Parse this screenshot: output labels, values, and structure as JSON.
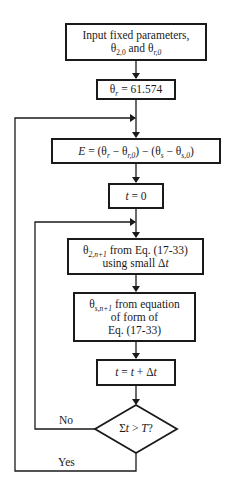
{
  "flowchart": {
    "boxes": {
      "input": {
        "line1": "Input fixed parameters,",
        "theta": "θ",
        "sub1": "2,0",
        "and": " and ",
        "sub2": "r,0"
      },
      "theta_r": {
        "theta": "θ",
        "sub": "r",
        "eq": " = 61.574"
      },
      "error": {
        "text_E": "E",
        "eq1": " = (θ",
        "sub_r": "r",
        "minus1": " − θ",
        "sub_r0": "r,0",
        "mid": ") − (θ",
        "sub_s": "s",
        "minus2": " − θ",
        "sub_s0": "s,0",
        "close": ")"
      },
      "t_init": {
        "t": "t",
        "eq": " = 0"
      },
      "theta2_step": {
        "theta": "θ",
        "sub": "2,n+1",
        "rest1": " from Eq. (17-33)",
        "line2a": "using small Δ",
        "line2b": "t"
      },
      "thetas_step": {
        "theta": "θ",
        "sub": "s,n+1",
        "rest1": " from equation",
        "line2": "of form of",
        "line3": "Eq. (17-33)"
      },
      "t_increment": {
        "t1": "t",
        "eq": " = ",
        "t2": "t",
        "plus": " + Δ",
        "t3": "t"
      }
    },
    "decision": {
      "sigma": "Σ",
      "t": "t",
      "gt": " > ",
      "T": "T",
      "q": "?"
    },
    "branches": {
      "no": "No",
      "yes": "Yes"
    }
  }
}
